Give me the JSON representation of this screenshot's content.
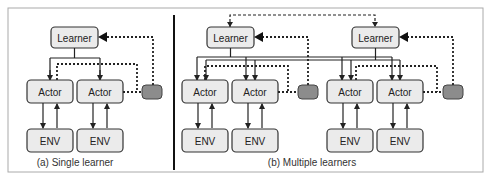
{
  "figure": {
    "panel_a": {
      "caption": "(a) Single learner",
      "learner_label": "Learner",
      "actor_labels": [
        "Actor",
        "Actor"
      ],
      "env_labels": [
        "ENV",
        "ENV"
      ]
    },
    "panel_b": {
      "caption": "(b) Multiple learners",
      "learner_labels": [
        "Learner",
        "Learner"
      ],
      "actor_labels": [
        "Actor",
        "Actor",
        "Actor",
        "Actor"
      ],
      "env_labels": [
        "ENV",
        "ENV",
        "ENV",
        "ENV"
      ]
    },
    "colors": {
      "box_fill": "#ebebeb",
      "box_stroke": "#333333",
      "buffer_fill": "#8c8c8c",
      "line": "#222222",
      "frame": "#999999"
    }
  }
}
